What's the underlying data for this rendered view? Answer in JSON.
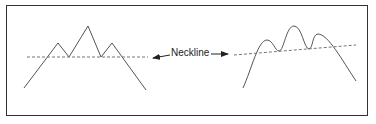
{
  "diagram": {
    "label": "Neckline",
    "colors": {
      "line": "#555555",
      "frame": "#333333",
      "neckline": "#777777"
    },
    "left_pattern": {
      "name": "head-and-shoulders-sharp",
      "points": "24,88 58,43 69,57 88,26 101,57 112,43 146,90",
      "neckline": {
        "x1": 27,
        "y1": 57,
        "x2": 148,
        "y2": 57
      }
    },
    "right_pattern": {
      "name": "head-and-shoulders-rounded",
      "path": "M243,88 C252,68 258,40 267,40 C273,40 275,51 279,51 C284,51 286,26 294,26 C302,26 304,49 309,49 C313,49 312,34 318,34 C328,34 342,60 356,81",
      "neckline": {
        "x1": 234,
        "y1": 55,
        "x2": 356,
        "y2": 45
      }
    }
  }
}
